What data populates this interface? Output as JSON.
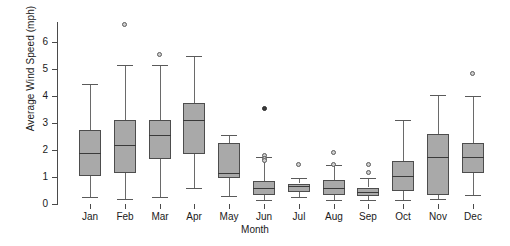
{
  "chart_data": {
    "type": "box",
    "title": "",
    "xlabel": "Month",
    "ylabel": "Average Wind Speed (mph)",
    "categories": [
      "Jan",
      "Feb",
      "Mar",
      "Apr",
      "May",
      "Jun",
      "Jul",
      "Aug",
      "Sep",
      "Oct",
      "Nov",
      "Dec"
    ],
    "ylim": [
      0,
      6.9
    ],
    "yticks": [
      0,
      1,
      2,
      3,
      4,
      5,
      6
    ],
    "ytick_labels": [
      "0",
      "1",
      "2",
      "3",
      "4",
      "5",
      "6"
    ],
    "grid": false,
    "legend": null,
    "boxes": [
      {
        "category": "Jan",
        "whisker_low": 0.25,
        "q1": 1.05,
        "median": 1.9,
        "q3": 2.75,
        "whisker_high": 4.45,
        "outliers": []
      },
      {
        "category": "Feb",
        "whisker_low": 0.2,
        "q1": 1.15,
        "median": 2.2,
        "q3": 3.1,
        "whisker_high": 5.15,
        "outliers": [
          6.65
        ]
      },
      {
        "category": "Mar",
        "whisker_low": 0.25,
        "q1": 1.65,
        "median": 2.55,
        "q3": 3.1,
        "whisker_high": 5.15,
        "outliers": [
          5.55
        ]
      },
      {
        "category": "Apr",
        "whisker_low": 0.6,
        "q1": 1.85,
        "median": 3.1,
        "q3": 3.75,
        "whisker_high": 5.5,
        "outliers": []
      },
      {
        "category": "May",
        "whisker_low": 0.3,
        "q1": 0.95,
        "median": 1.15,
        "q3": 2.25,
        "whisker_high": 2.55,
        "outliers": []
      },
      {
        "category": "Jun",
        "whisker_low": 0.15,
        "q1": 0.35,
        "median": 0.6,
        "q3": 0.85,
        "whisker_high": 1.75,
        "outliers": [
          3.55,
          1.8,
          1.7,
          1.6
        ]
      },
      {
        "category": "Jul",
        "whisker_low": 0.25,
        "q1": 0.45,
        "median": 0.65,
        "q3": 0.75,
        "whisker_high": 0.95,
        "outliers": [
          1.45
        ]
      },
      {
        "category": "Aug",
        "whisker_low": 0.15,
        "q1": 0.35,
        "median": 0.6,
        "q3": 0.9,
        "whisker_high": 1.45,
        "outliers": [
          1.9,
          1.45
        ]
      },
      {
        "category": "Sep",
        "whisker_low": 0.15,
        "q1": 0.3,
        "median": 0.45,
        "q3": 0.6,
        "whisker_high": 0.95,
        "outliers": [
          1.45,
          1.15
        ]
      },
      {
        "category": "Oct",
        "whisker_low": 0.15,
        "q1": 0.5,
        "median": 1.05,
        "q3": 1.6,
        "whisker_high": 3.1,
        "outliers": []
      },
      {
        "category": "Nov",
        "whisker_low": 0.2,
        "q1": 0.35,
        "median": 1.75,
        "q3": 2.6,
        "whisker_high": 4.05,
        "outliers": []
      },
      {
        "category": "Dec",
        "whisker_low": 0.35,
        "q1": 1.15,
        "median": 1.75,
        "q3": 2.25,
        "whisker_high": 4.0,
        "outliers": [
          4.85
        ]
      }
    ]
  },
  "colors": {
    "box_fill": "#a9a9a9",
    "box_edge": "#4d4d4d",
    "median": "#3a3a3a",
    "whisker": "#6a6a6a",
    "axis": "#4a4a4a",
    "text": "#1a1a1a",
    "outlier_fill": "#cfcfcf",
    "background": "#ffffff"
  }
}
